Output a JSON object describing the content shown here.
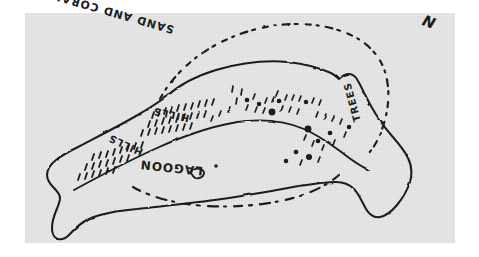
{
  "image": {
    "kind": "scanned hand-drawn sketch map",
    "orientation_note": "scan is upside-down; all lettering appears rotated 180 degrees",
    "paper_color": "#e7e7e7",
    "ink_color": "#1c1c1c",
    "scan_margin_color": "#ffffff"
  },
  "map": {
    "subject": "island / atoll sketch",
    "labels": {
      "sand_and_coral": "SAND AND CORAL",
      "lagoon": "LAGOON",
      "hills_upper": "HILLS",
      "hills_lower": "HILLS",
      "trees": "TREES",
      "north": "N"
    },
    "features": [
      {
        "name": "island-outline",
        "style": "solid freehand pen line, closed elongated crescent"
      },
      {
        "name": "outer-reef-dashed-arc",
        "style": "dashed / dotted arc above the island"
      },
      {
        "name": "lagoon-dashed-arc",
        "style": "dashed arc below the island"
      },
      {
        "name": "hill-hatching",
        "style": "dense short tick marks"
      },
      {
        "name": "tree-stipple",
        "style": "scattered dots and short strokes"
      },
      {
        "name": "islet",
        "style": "small closed blob inside the lagoon area"
      }
    ]
  }
}
